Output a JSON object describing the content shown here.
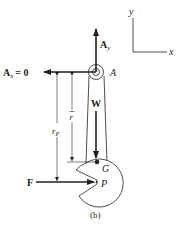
{
  "figure": {
    "caption": "(b)",
    "colors": {
      "ink": "#231f20",
      "background": "#ffffff"
    }
  },
  "axes": {
    "x_label": "x",
    "y_label": "y"
  },
  "pivot": {
    "label": "A"
  },
  "forces": {
    "ay": {
      "symbol": "A",
      "subscript": "y"
    },
    "ax": {
      "symbol": "A",
      "subscript": "x",
      "equals": "= 0"
    },
    "weight": {
      "symbol": "W"
    },
    "applied": {
      "symbol": "F"
    }
  },
  "points": {
    "center_of_mass": "G",
    "force_point": "P"
  },
  "dimensions": {
    "r_bar": {
      "symbol": "r"
    },
    "r_p": {
      "symbol": "r",
      "subscript": "P"
    }
  }
}
